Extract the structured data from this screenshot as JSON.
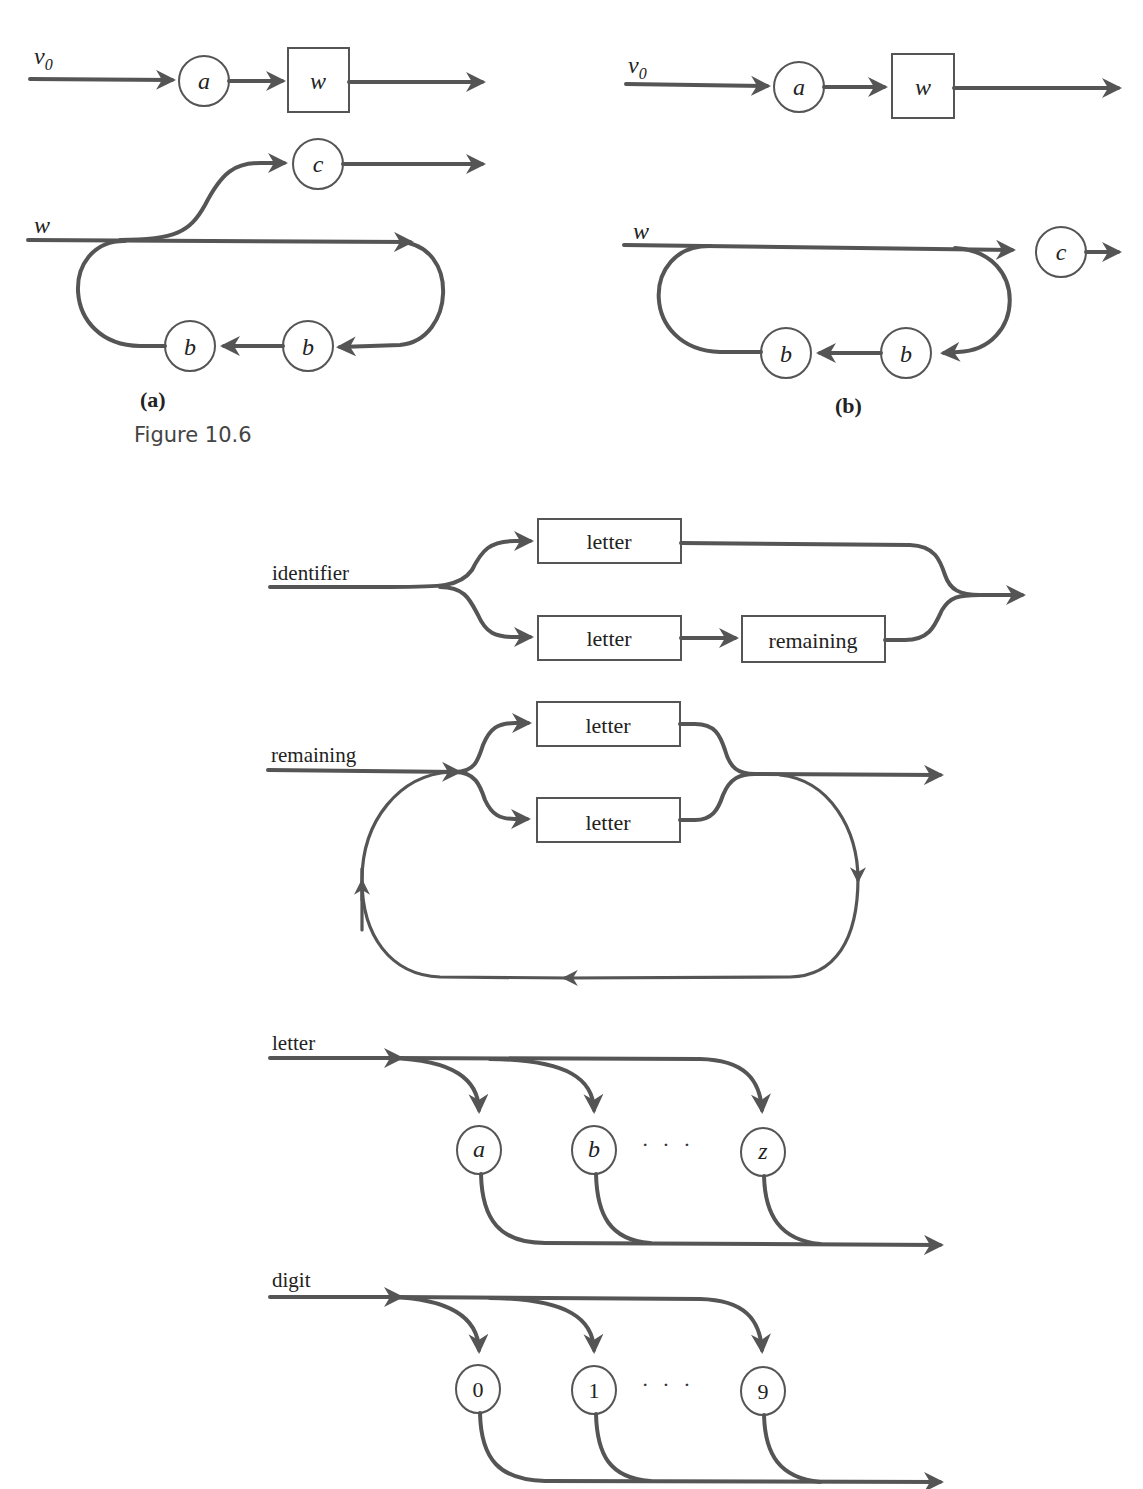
{
  "figure": {
    "caption": "Figure 10.6",
    "panels": [
      {
        "id": "a",
        "label": "(a)",
        "top": {
          "input": "v",
          "input_sub": "0",
          "nodes": [
            "a"
          ],
          "box": "w"
        },
        "bottom": {
          "input": "w",
          "exit_node": "c",
          "loop_nodes": [
            "b",
            "b"
          ]
        }
      },
      {
        "id": "b",
        "label": "(b)",
        "top": {
          "input": "v",
          "input_sub": "0",
          "nodes": [
            "a"
          ],
          "box": "w"
        },
        "bottom": {
          "input": "w",
          "exit_node": "c",
          "loop_nodes": [
            "b",
            "b"
          ]
        }
      }
    ]
  },
  "syntax_diagrams": {
    "identifier": {
      "name": "identifier",
      "upper_box": "letter",
      "lower_boxes": [
        "letter",
        "remaining"
      ]
    },
    "remaining": {
      "name": "remaining",
      "boxes": [
        "letter",
        "letter"
      ]
    },
    "letter": {
      "name": "letter",
      "nodes": [
        "a",
        "b",
        "z"
      ],
      "ellipsis": "· · ·"
    },
    "digit": {
      "name": "digit",
      "nodes": [
        "0",
        "1",
        "9"
      ],
      "ellipsis": "· · ·"
    }
  }
}
